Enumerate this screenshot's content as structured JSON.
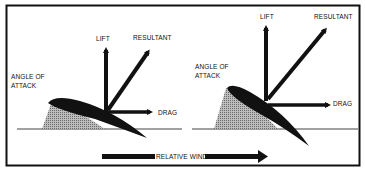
{
  "figure": {
    "panels": [
      {
        "id": "left",
        "labels": {
          "lift": "LIFT",
          "resultant": "RESULTANT",
          "angle_of_attack_line1": "ANGLE OF",
          "angle_of_attack_line2": "ATTACK",
          "drag": "DRAG"
        }
      },
      {
        "id": "right",
        "labels": {
          "lift": "LIFT",
          "resultant": "RESULTANT",
          "angle_of_attack_line1": "ANGLE OF",
          "angle_of_attack_line2": "ATTACK",
          "drag": "DRAG"
        }
      }
    ],
    "relative_wind_label": "RELATIVE WIND",
    "colors": {
      "ink": "#111111",
      "background": "#ffffff",
      "hatch": "#8a8a8a"
    }
  }
}
